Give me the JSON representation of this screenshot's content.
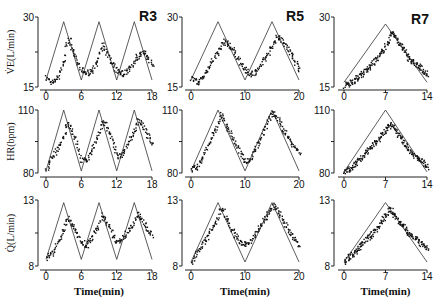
{
  "figure": {
    "columns": [
      {
        "id": "R3",
        "label": "R3",
        "x_ticks": [
          "0",
          "6",
          "12",
          "18"
        ],
        "xmax": 18,
        "period": 6
      },
      {
        "id": "R5",
        "label": "R5",
        "x_ticks": [
          "0",
          "10",
          "20"
        ],
        "xmax": 20,
        "period": 10
      },
      {
        "id": "R7",
        "label": "R7",
        "x_ticks": [
          "0",
          "7",
          "14"
        ],
        "xmax": 14,
        "period": 14
      }
    ],
    "rows": [
      {
        "id": "ve",
        "ylabel": "V̇E(L/min)",
        "ymin": 15,
        "ymax": 30,
        "y_ticks": [
          "15",
          "30"
        ]
      },
      {
        "id": "hr",
        "ylabel": "HR(bpm)",
        "ymin": 80,
        "ymax": 110,
        "y_ticks": [
          "80",
          "110"
        ]
      },
      {
        "id": "q",
        "ylabel": "Q̇(L/min)",
        "ymin": 8,
        "ymax": 13,
        "y_ticks": [
          "8",
          "13"
        ]
      }
    ],
    "xlabel": "Time(min)"
  },
  "chart_data": [
    {
      "type": "line",
      "title": "R3 - VE",
      "xlabel": "",
      "ylabel": "V̇E(L/min)",
      "xlim": [
        0,
        18
      ],
      "ylim": [
        15,
        30
      ],
      "series": [
        {
          "name": "work rate (triangular)",
          "x": [
            0,
            3,
            6,
            9,
            12,
            15,
            18
          ],
          "values": [
            16.5,
            29,
            16.5,
            29,
            16.5,
            29,
            16.5
          ]
        },
        {
          "name": "measured (scatter, approx)",
          "x": [
            0,
            1,
            2,
            3,
            3.5,
            4,
            5,
            6,
            7,
            8,
            9,
            9.5,
            10,
            11,
            12,
            13,
            14,
            15,
            16,
            17,
            18
          ],
          "values": [
            17,
            16,
            17.5,
            21,
            25,
            25,
            21,
            18.5,
            18,
            19,
            22,
            24,
            23.5,
            20,
            18.5,
            18,
            19,
            21,
            22.5,
            22,
            20
          ]
        }
      ]
    },
    {
      "type": "line",
      "title": "R5 - VE",
      "xlabel": "",
      "ylabel": "V̇E(L/min)",
      "xlim": [
        0,
        20
      ],
      "ylim": [
        15,
        30
      ],
      "series": [
        {
          "name": "work rate (triangular)",
          "x": [
            0,
            5,
            10,
            15,
            20
          ],
          "values": [
            16.5,
            29,
            16.5,
            29,
            16.5
          ]
        },
        {
          "name": "measured (scatter, approx)",
          "x": [
            0,
            1,
            2,
            3,
            4,
            5,
            6,
            7,
            8,
            9,
            10,
            11,
            12,
            13,
            14,
            15,
            16,
            17,
            18,
            19,
            20
          ],
          "values": [
            17,
            16,
            17,
            19,
            21,
            23,
            25,
            24,
            22.5,
            20.5,
            18.5,
            18,
            18.5,
            20,
            22,
            24,
            26,
            25,
            23,
            21,
            19
          ]
        }
      ]
    },
    {
      "type": "line",
      "title": "R7 - VE",
      "xlabel": "",
      "ylabel": "V̇E(L/min)",
      "xlim": [
        0,
        14
      ],
      "ylim": [
        15,
        30
      ],
      "series": [
        {
          "name": "work rate (triangular)",
          "x": [
            0,
            7,
            14
          ],
          "values": [
            16,
            28.5,
            16
          ]
        },
        {
          "name": "measured (scatter, approx)",
          "x": [
            0,
            1,
            2,
            3,
            4,
            5,
            6,
            7,
            8,
            9,
            10,
            11,
            12,
            13,
            14
          ],
          "values": [
            15.5,
            16,
            17,
            18,
            19,
            20.5,
            22,
            24,
            27,
            25,
            23,
            21,
            20,
            19,
            17.5
          ]
        }
      ]
    },
    {
      "type": "line",
      "title": "R3 - HR",
      "xlabel": "",
      "ylabel": "HR(bpm)",
      "xlim": [
        0,
        18
      ],
      "ylim": [
        80,
        110
      ],
      "series": [
        {
          "name": "work rate (triangular)",
          "x": [
            0,
            3,
            6,
            9,
            12,
            15,
            18
          ],
          "values": [
            81,
            110,
            81,
            110,
            81,
            110,
            81
          ]
        },
        {
          "name": "measured (scatter, approx)",
          "x": [
            0,
            1,
            2,
            3,
            3.5,
            4,
            5,
            6,
            7,
            8,
            9,
            9.5,
            10,
            11,
            12,
            13,
            14,
            15,
            15.5,
            16,
            17,
            18
          ],
          "values": [
            82,
            88,
            92,
            98,
            104,
            103,
            96,
            86,
            87,
            93,
            99,
            105,
            104,
            97,
            88,
            89,
            95,
            101,
            106,
            104,
            99,
            94
          ]
        }
      ]
    },
    {
      "type": "line",
      "title": "R5 - HR",
      "xlabel": "",
      "ylabel": "HR(bpm)",
      "xlim": [
        0,
        20
      ],
      "ylim": [
        80,
        110
      ],
      "series": [
        {
          "name": "work rate (triangular)",
          "x": [
            0,
            5,
            10,
            15,
            20
          ],
          "values": [
            81,
            110,
            81,
            110,
            81
          ]
        },
        {
          "name": "measured (scatter, approx)",
          "x": [
            0,
            1,
            2,
            3,
            4,
            5,
            5.5,
            6,
            7,
            8,
            9,
            10,
            11,
            12,
            13,
            14,
            15,
            16,
            17,
            18,
            19,
            20
          ],
          "values": [
            82,
            83,
            87,
            93,
            99,
            104,
            108,
            106,
            100,
            95,
            90,
            86,
            87,
            93,
            98,
            104,
            109,
            106,
            101,
            97,
            93,
            90
          ]
        }
      ]
    },
    {
      "type": "line",
      "title": "R7 - HR",
      "xlabel": "",
      "ylabel": "HR(bpm)",
      "xlim": [
        0,
        14
      ],
      "ylim": [
        80,
        110
      ],
      "series": [
        {
          "name": "work rate (triangular)",
          "x": [
            0,
            7,
            14
          ],
          "values": [
            80.5,
            110,
            80.5
          ]
        },
        {
          "name": "measured (scatter, approx)",
          "x": [
            0,
            1,
            2,
            3,
            4,
            5,
            6,
            7,
            8,
            9,
            10,
            11,
            12,
            13,
            14
          ],
          "values": [
            81,
            82,
            85,
            88,
            91,
            94,
            97,
            101,
            104,
            99,
            95,
            91,
            88,
            86,
            83
          ]
        }
      ]
    },
    {
      "type": "line",
      "title": "R3 - Q",
      "xlabel": "Time(min)",
      "ylabel": "Q̇(L/min)",
      "xlim": [
        0,
        18
      ],
      "ylim": [
        8,
        13
      ],
      "series": [
        {
          "name": "work rate (triangular)",
          "x": [
            0,
            3,
            6,
            9,
            12,
            15,
            18
          ],
          "values": [
            8.5,
            12.8,
            8.5,
            12.8,
            8.5,
            12.8,
            8.5
          ]
        },
        {
          "name": "measured (scatter, approx)",
          "x": [
            0,
            1,
            2,
            3,
            3.5,
            4,
            5,
            6,
            7,
            8,
            9,
            9.5,
            10,
            11,
            12,
            13,
            14,
            15,
            15.5,
            16,
            17,
            18
          ],
          "values": [
            8.7,
            9,
            10,
            10.9,
            11.7,
            11.5,
            10.6,
            9.8,
            9.6,
            10.4,
            11.2,
            12,
            11.6,
            10.6,
            9.8,
            10.2,
            10.8,
            11.4,
            12.1,
            11.6,
            11,
            10.4
          ]
        }
      ]
    },
    {
      "type": "line",
      "title": "R5 - Q",
      "xlabel": "Time(min)",
      "ylabel": "Q̇(L/min)",
      "xlim": [
        0,
        20
      ],
      "ylim": [
        8,
        13
      ],
      "series": [
        {
          "name": "work rate (triangular)",
          "x": [
            0,
            5,
            10,
            15,
            20
          ],
          "values": [
            8.3,
            12.8,
            8.3,
            12.8,
            8.3
          ]
        },
        {
          "name": "measured (scatter, approx)",
          "x": [
            0,
            1,
            2,
            3,
            4,
            5,
            5.5,
            6,
            7,
            8,
            9,
            10,
            11,
            12,
            13,
            14,
            15,
            16,
            17,
            18,
            19,
            20
          ],
          "values": [
            8.4,
            9,
            9.7,
            10.3,
            11,
            11.7,
            12.4,
            12.2,
            11.3,
            10.4,
            9.8,
            9.6,
            10,
            10.6,
            11.2,
            11.9,
            12.6,
            12.2,
            11.4,
            10.7,
            10.1,
            9.5
          ]
        }
      ]
    },
    {
      "type": "line",
      "title": "R7 - Q",
      "xlabel": "Time(min)",
      "ylabel": "Q̇(L/min)",
      "xlim": [
        0,
        14
      ],
      "ylim": [
        8,
        13
      ],
      "series": [
        {
          "name": "work rate (triangular)",
          "x": [
            0,
            7,
            14
          ],
          "values": [
            8.3,
            12.8,
            8.3
          ]
        },
        {
          "name": "measured (scatter, approx)",
          "x": [
            0,
            1,
            2,
            3,
            4,
            5,
            6,
            7,
            7.5,
            8,
            9,
            10,
            11,
            12,
            13,
            14
          ],
          "values": [
            8.4,
            8.8,
            9.2,
            9.7,
            10.2,
            10.6,
            11.2,
            11.9,
            12.4,
            12.2,
            11.5,
            11,
            10.5,
            10.1,
            9.7,
            9.3
          ]
        }
      ]
    }
  ]
}
